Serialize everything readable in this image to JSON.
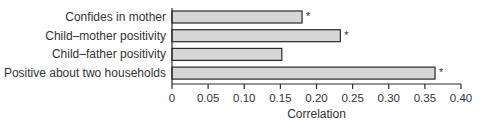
{
  "chart_data": {
    "type": "bar",
    "orientation": "horizontal",
    "title": "",
    "xlabel": "Correlation",
    "ylabel": "",
    "xlim": [
      0,
      0.4
    ],
    "xticks": [
      "0",
      "0.05",
      "0.10",
      "0.15",
      "0.20",
      "0.25",
      "0.30",
      "0.35",
      "0.40"
    ],
    "xtick_values": [
      0,
      0.05,
      0.1,
      0.15,
      0.2,
      0.25,
      0.3,
      0.35,
      0.4
    ],
    "categories": [
      "Confides in mother",
      "Child–mother positivity",
      "Child–father positivity",
      "Positive about two households"
    ],
    "values": [
      0.18,
      0.233,
      0.152,
      0.364
    ],
    "significant": [
      true,
      true,
      false,
      true
    ],
    "significance_marker": "*",
    "grid": false,
    "legend": null,
    "bar_color": "#d6d6d6",
    "edge_color": "#2a2a2a"
  }
}
